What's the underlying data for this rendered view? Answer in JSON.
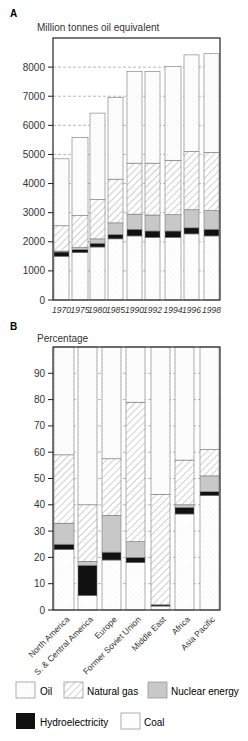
{
  "panel_a": {
    "letter": "A",
    "unit_label": "Million tonnes oil equivalent"
  },
  "panel_b": {
    "letter": "B",
    "unit_label": "Percentage"
  },
  "legend": [
    {
      "key": "oil",
      "label": "Oil"
    },
    {
      "key": "gas",
      "label": "Natural gas"
    },
    {
      "key": "nuclear",
      "label": "Nuclear energy"
    },
    {
      "key": "hydro",
      "label": "Hydroelectricity"
    },
    {
      "key": "coal",
      "label": "Coal"
    }
  ],
  "colors": {
    "frame": "#222222",
    "grid": "#888888",
    "hydro": "#111111",
    "nuclear": "#c8c8c8",
    "dots": "#9a9a9a",
    "hatch": "#888888"
  },
  "chart_data": [
    {
      "type": "bar",
      "stacked": true,
      "title": "A",
      "ylabel": "Million tonnes oil equivalent",
      "xlabel": "",
      "ylim": [
        0,
        9000
      ],
      "yticks": [
        0,
        1000,
        2000,
        3000,
        4000,
        5000,
        6000,
        7000,
        8000
      ],
      "grid": true,
      "categories": [
        "1970",
        "1975",
        "1980",
        "1985",
        "1990",
        "1992",
        "1994",
        "1996",
        "1998"
      ],
      "series": [
        {
          "name": "Coal",
          "values": [
            1500,
            1630,
            1820,
            2100,
            2200,
            2150,
            2150,
            2270,
            2200
          ]
        },
        {
          "name": "Hydroelectricity",
          "values": [
            150,
            100,
            130,
            150,
            230,
            220,
            220,
            210,
            230
          ]
        },
        {
          "name": "Nuclear energy",
          "values": [
            30,
            70,
            150,
            400,
            520,
            550,
            560,
            620,
            640
          ]
        },
        {
          "name": "Natural gas",
          "values": [
            870,
            1100,
            1350,
            1500,
            1750,
            1780,
            1870,
            2000,
            2000
          ]
        },
        {
          "name": "Oil",
          "values": [
            2300,
            2680,
            2970,
            2800,
            3150,
            3150,
            3220,
            3320,
            3390
          ]
        }
      ],
      "totals": [
        4850,
        5580,
        6420,
        6950,
        7850,
        7850,
        8020,
        8420,
        8460
      ]
    },
    {
      "type": "bar",
      "stacked": true,
      "title": "B",
      "ylabel": "Percentage",
      "xlabel": "",
      "ylim": [
        0,
        100
      ],
      "yticks": [
        0,
        10,
        20,
        30,
        40,
        50,
        60,
        70,
        80,
        90
      ],
      "grid": true,
      "categories": [
        "North America",
        "S. & Central America",
        "Europe",
        "Former Soviet Union",
        "Middle East",
        "Africa",
        "Asia Pacific"
      ],
      "series": [
        {
          "name": "Coal",
          "values": [
            23,
            5.5,
            19,
            18,
            1.5,
            36.5,
            43.5
          ]
        },
        {
          "name": "Hydroelectricity",
          "values": [
            2,
            11.5,
            3,
            2,
            0.5,
            2.5,
            1.5
          ]
        },
        {
          "name": "Nuclear energy",
          "values": [
            8,
            1.5,
            14,
            6,
            0,
            1,
            6
          ]
        },
        {
          "name": "Natural gas",
          "values": [
            26,
            21.5,
            21.5,
            53,
            42,
            17,
            10
          ]
        },
        {
          "name": "Oil",
          "values": [
            41,
            60,
            42.5,
            21,
            56,
            43,
            39
          ]
        }
      ]
    }
  ]
}
